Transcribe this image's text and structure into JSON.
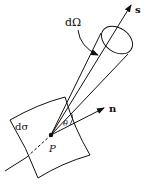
{
  "diagram": {
    "labels": {
      "solid_angle": "dΩ",
      "direction": "s",
      "normal": "n",
      "area": "dσ",
      "point": "P",
      "angle": "θ"
    },
    "colors": {
      "stroke": "#111111",
      "background": "#ffffff"
    }
  }
}
